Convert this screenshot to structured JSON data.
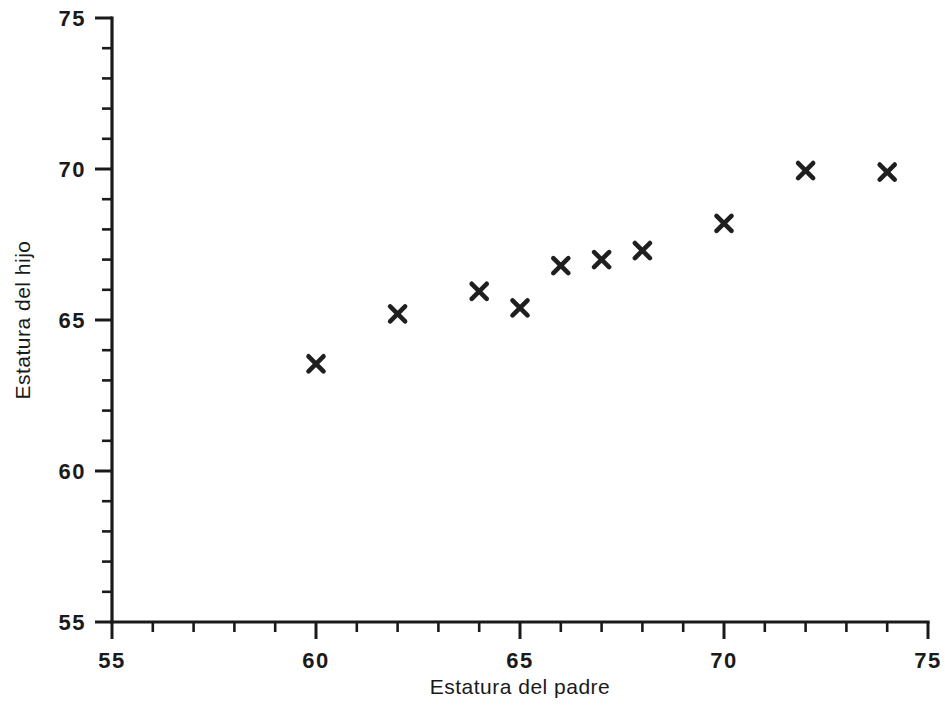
{
  "chart_data": {
    "type": "scatter",
    "title": "",
    "xlabel": "Estatura del padre",
    "ylabel": "Estatura del hijo",
    "xlim": [
      55,
      75
    ],
    "ylim": [
      55,
      75
    ],
    "x_major_ticks": [
      55,
      60,
      65,
      70,
      75
    ],
    "y_major_ticks": [
      55,
      60,
      65,
      70,
      75
    ],
    "x_tick_labels": [
      "55",
      "60",
      "65",
      "70",
      "75"
    ],
    "y_tick_labels": [
      "55",
      "60",
      "65",
      "70",
      "75"
    ],
    "x_minor_tick_step": 1,
    "y_minor_tick_step": 1,
    "grid": false,
    "legend": false,
    "marker": "x",
    "marker_color": "#1f1f1f",
    "axis_color": "#1a1a1a",
    "background_color": "#ffffff",
    "x": [
      60,
      62,
      64,
      65,
      66,
      67,
      68,
      70,
      72,
      74
    ],
    "y": [
      63.55,
      65.2,
      65.95,
      65.4,
      66.8,
      67.0,
      67.3,
      68.2,
      69.95,
      69.9
    ],
    "points": [
      {
        "x": 60,
        "y": 63.55
      },
      {
        "x": 62,
        "y": 65.2
      },
      {
        "x": 64,
        "y": 65.95
      },
      {
        "x": 65,
        "y": 65.4
      },
      {
        "x": 66,
        "y": 66.8
      },
      {
        "x": 67,
        "y": 67.0
      },
      {
        "x": 68,
        "y": 67.3
      },
      {
        "x": 70,
        "y": 68.2
      },
      {
        "x": 72,
        "y": 69.95
      },
      {
        "x": 74,
        "y": 69.9
      }
    ]
  }
}
